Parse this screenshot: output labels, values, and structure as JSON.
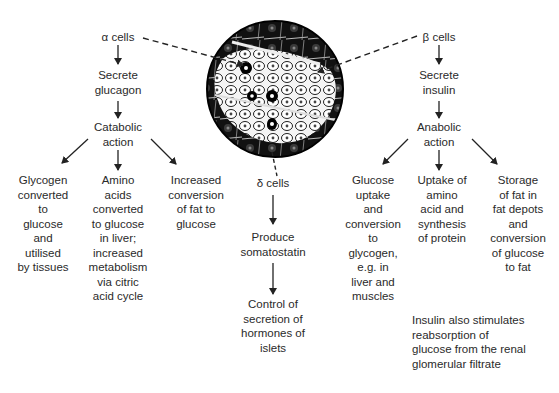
{
  "alpha": {
    "label": "α cells",
    "secrete": "Secrete\nglucagon",
    "action": "Catabolic\naction",
    "effects": [
      "Glycogen\nconverted\nto\nglucose\nand\nutilised\nby tissues",
      "Amino\nacids\nconverted\nto glucose\nin liver;\nincreased\nmetabolism\nvia citric\nacid cycle",
      "Increased\nconversion\nof fat to\nglucose"
    ]
  },
  "delta": {
    "label": "δ cells",
    "produce": "Produce\nsomatostatin",
    "effect": "Control of\nsecretion of\nhormones of\nislets"
  },
  "beta": {
    "label": "β cells",
    "secrete": "Secrete\ninsulin",
    "action": "Anabolic\naction",
    "effects": [
      "Glucose\nuptake\nand\nconversion\nto\nglycogen,\ne.g. in\nliver and\nmuscles",
      "Uptake of\namino\nacid and\nsynthesis\nof protein",
      "Storage\nof fat in\nfat depots\nand\nconversion\nof glucose\nto fat"
    ],
    "note": "Insulin also stimulates\nreabsorption of\nglucose from the renal\nglomerular filtrate"
  },
  "illustration": {
    "name": "pancreatic islet micrograph"
  }
}
